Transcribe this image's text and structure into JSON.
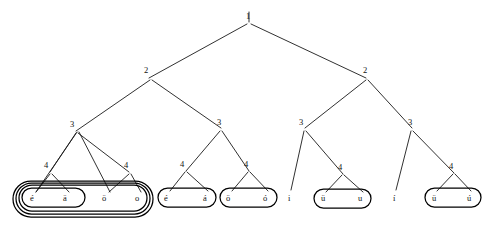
{
  "diagram": {
    "type": "linguistic-feature-geometry-tree",
    "width": 487,
    "height": 228,
    "background_color": "#ffffff",
    "line_color": "#1a1a1a",
    "capsule_color": "#000000",
    "root": {
      "label": "1",
      "x": 248,
      "y": 18
    },
    "tier2": [
      {
        "label": "2",
        "x": 146,
        "y": 72
      },
      {
        "label": "2",
        "x": 365,
        "y": 72
      }
    ],
    "tier3": [
      {
        "label": "3",
        "x": 73,
        "y": 126
      },
      {
        "label": "3",
        "x": 220,
        "y": 124
      },
      {
        "label": "3",
        "x": 304,
        "y": 124
      },
      {
        "label": "3",
        "x": 411,
        "y": 124
      }
    ],
    "tier4": [
      {
        "label": "4",
        "x": 48,
        "y": 167
      },
      {
        "label": "4",
        "x": 127,
        "y": 167
      },
      {
        "label": "4",
        "x": 184,
        "y": 166
      },
      {
        "label": "4",
        "x": 247,
        "y": 166
      },
      {
        "label": "4",
        "x": 341,
        "y": 169
      },
      {
        "label": "4",
        "x": 452,
        "y": 168
      }
    ],
    "leaf_groups": [
      {
        "name": "front-back-rounded-group",
        "nesting_depth": 4,
        "leaves": [
          {
            "text": "é",
            "x": 33,
            "y": 197
          },
          {
            "text": "ä",
            "x": 66,
            "y": 197
          },
          {
            "text": "ö",
            "x": 105,
            "y": 197
          },
          {
            "text": "o",
            "x": 137,
            "y": 197
          }
        ]
      },
      {
        "name": "long-front-unrounded-group",
        "nesting_depth": 1,
        "leaves": [
          {
            "text": "é",
            "x": 167,
            "y": 197
          },
          {
            "text": "á",
            "x": 205,
            "y": 197
          }
        ]
      },
      {
        "name": "long-rounded-group",
        "nesting_depth": 1,
        "leaves": [
          {
            "text": "ö",
            "x": 228,
            "y": 197
          },
          {
            "text": "ó",
            "x": 265,
            "y": 197
          }
        ]
      },
      {
        "name": "high-unrounded-singleton",
        "nesting_depth": 0,
        "leaves": [
          {
            "text": "i",
            "x": 289,
            "y": 197
          }
        ]
      },
      {
        "name": "high-rounded-group",
        "nesting_depth": 1,
        "leaves": [
          {
            "text": "ü",
            "x": 323,
            "y": 197
          },
          {
            "text": "u",
            "x": 360,
            "y": 197
          }
        ]
      },
      {
        "name": "long-high-unrounded-singleton",
        "nesting_depth": 0,
        "leaves": [
          {
            "text": "í",
            "x": 394,
            "y": 197
          }
        ]
      },
      {
        "name": "long-high-rounded-group",
        "nesting_depth": 1,
        "leaves": [
          {
            "text": "ü",
            "x": 434,
            "y": 197
          },
          {
            "text": "ú",
            "x": 469,
            "y": 197
          }
        ]
      }
    ]
  }
}
